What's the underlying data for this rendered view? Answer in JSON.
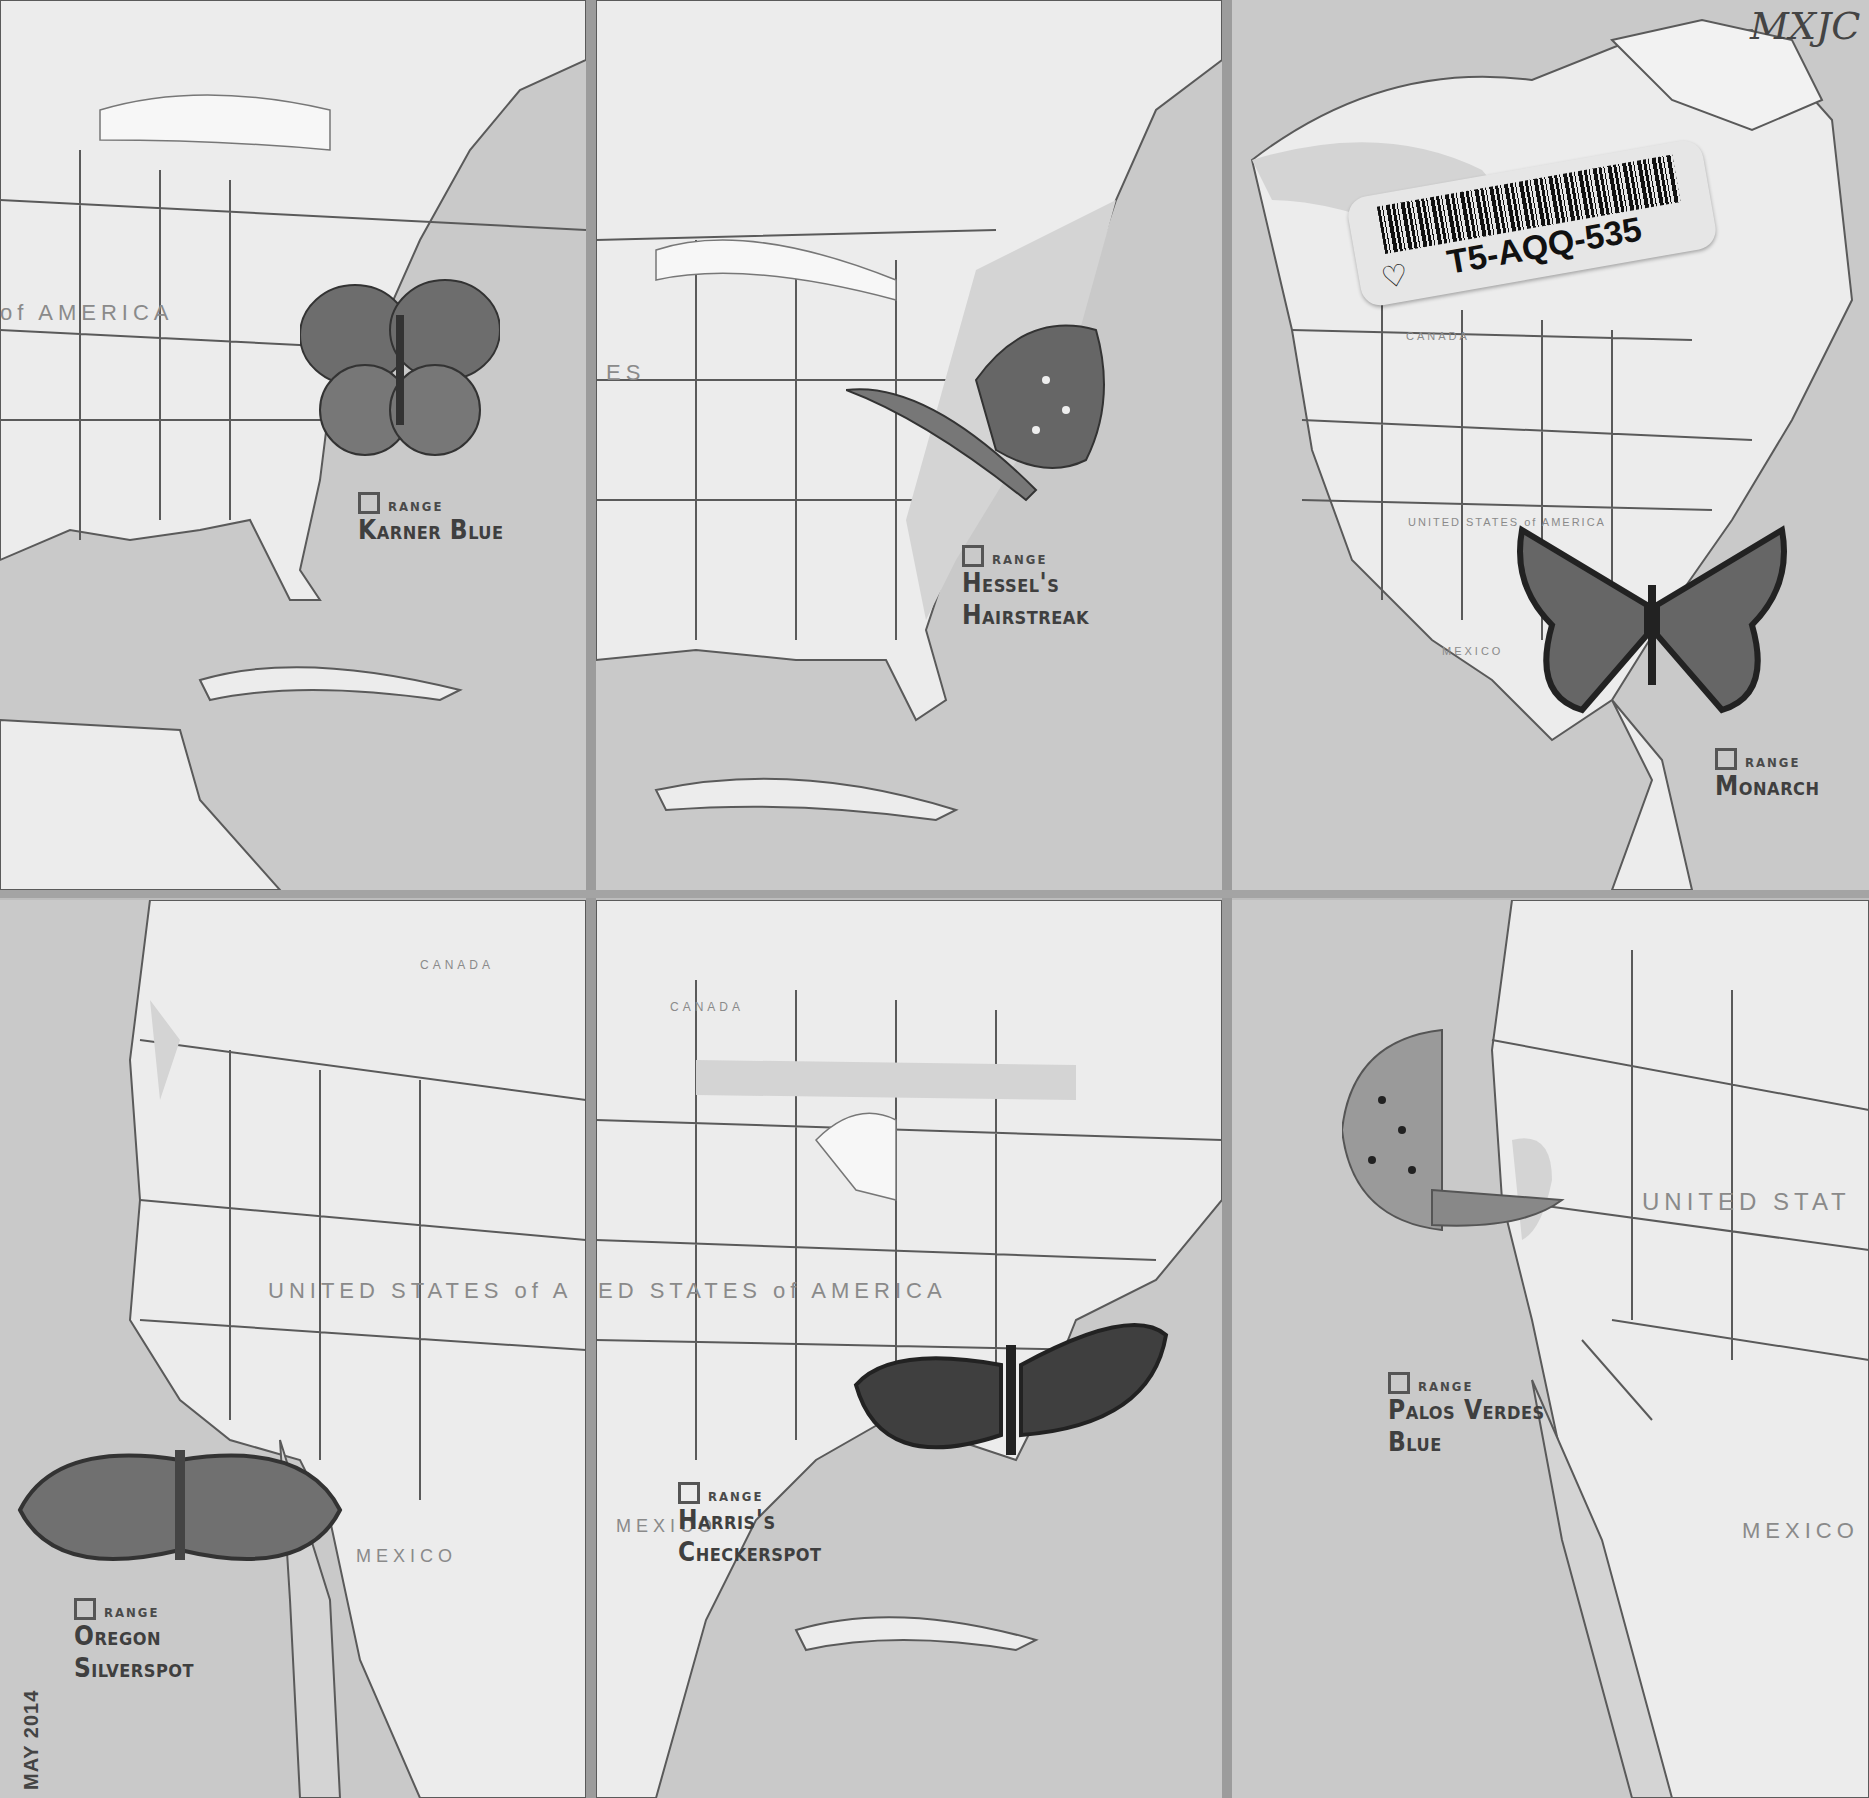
{
  "sheet": {
    "library_stamp": "TULSA CITY-COUNTY LIBRARY",
    "barcode_label": "T5-AQQ-535",
    "handwritten_code": "MXJC",
    "printing_date": "MAY   2014"
  },
  "stamps": [
    {
      "id": "karner-blue",
      "range_label": "RANGE",
      "name_line1": "Karner Blue",
      "name_line2": "",
      "map_labels": [
        "of AMERICA"
      ]
    },
    {
      "id": "hessels-hairstreak",
      "range_label": "RANGE",
      "name_line1": "Hessel's",
      "name_line2": "Hairstreak",
      "map_labels": [
        "ES"
      ]
    },
    {
      "id": "monarch",
      "range_label": "RANGE",
      "name_line1": "Monarch",
      "name_line2": "",
      "map_labels": [
        "CANADA",
        "UNITED STATES of AMERICA",
        "MEXICO"
      ]
    },
    {
      "id": "oregon-silverspot",
      "range_label": "RANGE",
      "name_line1": "Oregon",
      "name_line2": "Silverspot",
      "map_labels": [
        "CANADA",
        "UNITED STATES of A",
        "MEXICO"
      ]
    },
    {
      "id": "harriss-checkerspot",
      "range_label": "RANGE",
      "name_line1": "Harris's",
      "name_line2": "Checkerspot",
      "map_labels": [
        "CANADA",
        "ED STATES of AMERICA",
        "MEXICO"
      ]
    },
    {
      "id": "palos-verdes-blue",
      "range_label": "RANGE",
      "name_line1": "Palos Verdes",
      "name_line2": "Blue",
      "map_labels": [
        "UNITED STAT",
        "MEXICO"
      ]
    }
  ],
  "colors": {
    "ocean_range": "#c8c8c8",
    "land": "#ececec",
    "border": "#5a5a5a",
    "text": "#444444"
  }
}
